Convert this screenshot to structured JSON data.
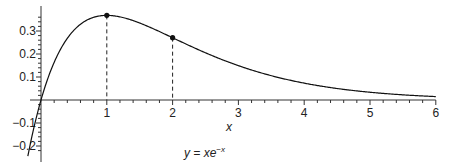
{
  "chart_data": {
    "type": "line",
    "title": "",
    "caption": "y = xe^{-x}",
    "xlabel": "x",
    "ylabel": "",
    "xlim": [
      -0.25,
      6
    ],
    "ylim": [
      -0.23,
      0.37
    ],
    "x_ticks": [
      1,
      2,
      3,
      4,
      5,
      6
    ],
    "x_minor_step": 0.2,
    "y_ticks": [
      -0.2,
      -0.1,
      0.1,
      0.2,
      0.3
    ],
    "y_minor_step": 0.02,
    "grid": false,
    "legend": null,
    "series": [
      {
        "name": "y = xe^{-x}",
        "function": "x*exp(-x)",
        "domain": [
          -0.2,
          6
        ]
      }
    ],
    "highlighted_points": [
      {
        "x": 1,
        "y": 0.368,
        "dropline": true
      },
      {
        "x": 2,
        "y": 0.271,
        "dropline": true
      }
    ]
  },
  "labels": {
    "x_axis_title": "x",
    "caption_prefix": "y = xe",
    "caption_exp": "−x",
    "x_tick_labels": [
      "1",
      "2",
      "3",
      "4",
      "5",
      "6"
    ],
    "y_tick_labels": [
      "0.3",
      "0.2",
      "0.1",
      "−0.1",
      "−0.2"
    ]
  },
  "colors": {
    "curve": "#111111",
    "axis": "#333333",
    "background": "#ffffff"
  }
}
